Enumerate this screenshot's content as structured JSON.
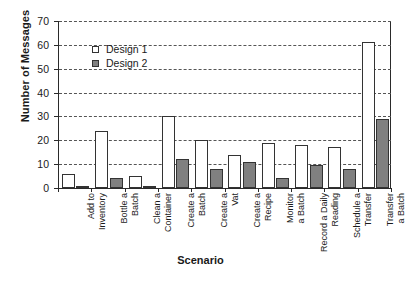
{
  "chart_data": {
    "type": "bar",
    "title": "",
    "xlabel": "Scenario",
    "ylabel": "Number of Messages",
    "ylim": [
      0,
      70
    ],
    "ytick_step": 10,
    "yticks": [
      "70",
      "60",
      "50",
      "40",
      "30",
      "20",
      "10",
      "0"
    ],
    "grid": "horizontal-dashed",
    "legend_position": "top-left-inside",
    "categories": [
      "Add to\nInventory",
      "Bottle a\nBatch",
      "Clean a\nContainer",
      "Create a\nBatch",
      "Create a\nVat",
      "Create a\nRecipe",
      "Monitor\na Batch",
      "Record a Daily\nReading",
      "Schedule a\nTransfer",
      "Transfer\na Batch"
    ],
    "series": [
      {
        "name": "Design 1",
        "color": "#ffffff",
        "values": [
          6,
          24,
          5,
          30,
          20,
          14,
          19,
          18,
          17,
          61
        ]
      },
      {
        "name": "Design 2",
        "color": "#808080",
        "values": [
          1,
          4,
          1,
          12,
          8,
          11,
          4,
          9.5,
          8,
          29
        ]
      }
    ]
  },
  "legend": {
    "items": [
      {
        "label": "Design 1"
      },
      {
        "label": "Design 2"
      }
    ]
  },
  "axes": {
    "y_title": "Number of Messages",
    "x_title": "Scenario"
  }
}
